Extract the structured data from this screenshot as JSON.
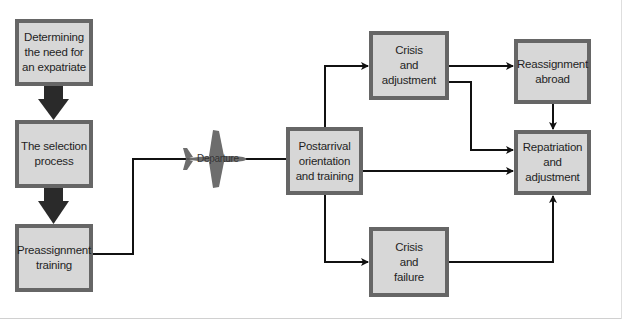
{
  "diagram": {
    "title_fragment": "",
    "colors": {
      "box_fill": "#d7d7d7",
      "box_border": "#666666",
      "connector": "#111111",
      "thick_arrow": "#2a2a2a",
      "plane": "#6a6a6a"
    },
    "nodes": [
      {
        "id": "need",
        "label": "Determining\nthe need for\nan expatriate"
      },
      {
        "id": "selection",
        "label": "The selection\nprocess"
      },
      {
        "id": "preassignment",
        "label": "Preassignment\ntraining"
      },
      {
        "id": "postarrival",
        "label": "Postarrival\norientation\nand training"
      },
      {
        "id": "crisis_adjustment",
        "label": "Crisis\nand\nadjustment"
      },
      {
        "id": "crisis_failure",
        "label": "Crisis\nand\nfailure"
      },
      {
        "id": "reassignment",
        "label": "Reassignment\nabroad"
      },
      {
        "id": "repatriation",
        "label": "Repatriation\nand\nadjustment"
      }
    ],
    "departure_label": "Departure",
    "edges": [
      {
        "from": "need",
        "to": "selection",
        "style": "thick"
      },
      {
        "from": "selection",
        "to": "preassignment",
        "style": "thick"
      },
      {
        "from": "preassignment",
        "to": "postarrival",
        "style": "line",
        "via": "Departure"
      },
      {
        "from": "postarrival",
        "to": "crisis_adjustment",
        "style": "arrow"
      },
      {
        "from": "postarrival",
        "to": "repatriation",
        "style": "arrow"
      },
      {
        "from": "postarrival",
        "to": "crisis_failure",
        "style": "arrow"
      },
      {
        "from": "crisis_adjustment",
        "to": "reassignment",
        "style": "arrow"
      },
      {
        "from": "crisis_adjustment",
        "to": "repatriation",
        "style": "arrow"
      },
      {
        "from": "reassignment",
        "to": "repatriation",
        "style": "arrow"
      },
      {
        "from": "crisis_failure",
        "to": "repatriation",
        "style": "arrow"
      }
    ]
  }
}
